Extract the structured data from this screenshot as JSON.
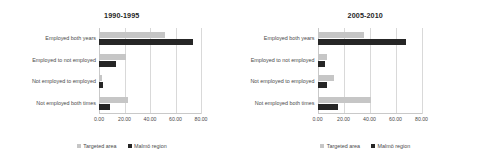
{
  "figure": {
    "series_colors": {
      "targeted_area": "#c6c6c6",
      "malmo_region": "#262626"
    },
    "legend": {
      "targeted_area_label": "Targeted area",
      "malmo_region_label": "Malmö region"
    }
  },
  "chart_data": [
    {
      "type": "bar",
      "orientation": "horizontal",
      "title": "1990-1995",
      "xlabel": "",
      "ylabel": "",
      "xlim": [
        0,
        80
      ],
      "grid": true,
      "legend_position": "bottom",
      "tick_labels": [
        "0.00",
        "20.00",
        "40.00",
        "60.00",
        "80.00"
      ],
      "tick_values": [
        0,
        20,
        40,
        60,
        80
      ],
      "categories": [
        "Employed both years",
        "Employed to not employed",
        "Not employed to employed",
        "Not employed both times"
      ],
      "series": [
        {
          "name": "Targeted area",
          "values": [
            52.0,
            21.0,
            2.5,
            23.0
          ]
        },
        {
          "name": "Malmö region",
          "values": [
            74.0,
            13.5,
            3.0,
            8.5
          ]
        }
      ]
    },
    {
      "type": "bar",
      "orientation": "horizontal",
      "title": "2005-2010",
      "xlabel": "",
      "ylabel": "",
      "xlim": [
        0,
        80
      ],
      "grid": true,
      "legend_position": "bottom",
      "tick_labels": [
        "0.00",
        "20.00",
        "40.00",
        "60.00",
        "80.00"
      ],
      "tick_values": [
        0,
        20,
        40,
        60,
        80
      ],
      "categories": [
        "Employed both years",
        "Employed to not employed",
        "Not employed to employed",
        "Not employed both times"
      ],
      "series": [
        {
          "name": "Targeted area",
          "values": [
            36.0,
            7.5,
            13.0,
            41.0
          ]
        },
        {
          "name": "Malmö region",
          "values": [
            68.0,
            6.0,
            7.0,
            16.0
          ]
        }
      ]
    }
  ]
}
